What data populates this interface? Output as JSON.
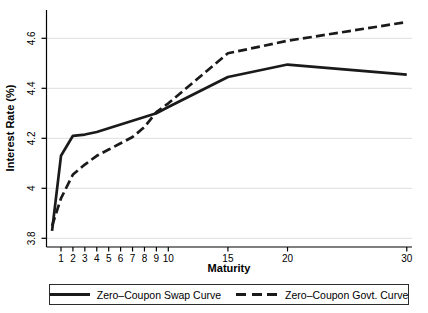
{
  "chart_data": {
    "type": "line",
    "title": "",
    "xlabel": "Maturity",
    "ylabel": "Interest Rate (%)",
    "xlim": [
      0.25,
      30
    ],
    "ylim": [
      3.8,
      4.6
    ],
    "xticks": [
      "1",
      "2",
      "3",
      "4",
      "5",
      "6",
      "7",
      "8",
      "9",
      "10",
      "15",
      "20",
      "30"
    ],
    "xtick_values": [
      1,
      2,
      3,
      4,
      5,
      6,
      7,
      8,
      9,
      10,
      15,
      20,
      30
    ],
    "yticks": [
      "3.8",
      "4",
      "4.2",
      "4.4",
      "4.6"
    ],
    "ytick_values": [
      3.8,
      4.0,
      4.2,
      4.4,
      4.6
    ],
    "grid": "horizontal",
    "legend_position": "bottom",
    "x": [
      0.25,
      1,
      2,
      3,
      4,
      5,
      6,
      7,
      8,
      9,
      10,
      15,
      20,
      30
    ],
    "series": [
      {
        "name": "Zero–Coupon Swap Curve",
        "style": "solid",
        "color": "#1a1a1a",
        "values": [
          3.83,
          4.13,
          4.21,
          4.215,
          4.225,
          4.24,
          4.255,
          4.27,
          4.285,
          4.3,
          4.325,
          4.445,
          4.495,
          4.455
        ]
      },
      {
        "name": "Zero–Coupon Govt. Curve",
        "style": "dashed",
        "color": "#1a1a1a",
        "values": [
          3.85,
          3.96,
          4.055,
          4.095,
          4.13,
          4.155,
          4.18,
          4.205,
          4.245,
          4.305,
          4.34,
          4.54,
          4.59,
          4.665
        ]
      }
    ]
  },
  "colors": {
    "background": "#ffffff",
    "grid": "#dedede",
    "axis": "#000000",
    "line": "#1a1a1a"
  }
}
